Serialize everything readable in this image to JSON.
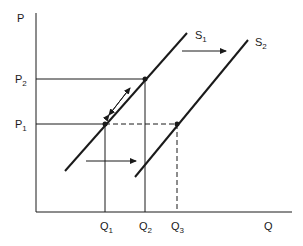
{
  "diagram": {
    "axes": {
      "y_label": "P",
      "x_label": "Q"
    },
    "price_levels": [
      {
        "id": "P2",
        "main": "P",
        "sub": "2"
      },
      {
        "id": "P1",
        "main": "P",
        "sub": "1"
      }
    ],
    "quantity_levels": [
      {
        "id": "Q1",
        "main": "Q",
        "sub": "1"
      },
      {
        "id": "Q2",
        "main": "Q",
        "sub": "2"
      },
      {
        "id": "Q3",
        "main": "Q",
        "sub": "3"
      }
    ],
    "curves": [
      {
        "id": "S1",
        "main": "S",
        "sub": "1"
      },
      {
        "id": "S2",
        "main": "S",
        "sub": "2"
      }
    ],
    "colors": {
      "line": "#1a1a1a",
      "background": "#ffffff"
    }
  }
}
